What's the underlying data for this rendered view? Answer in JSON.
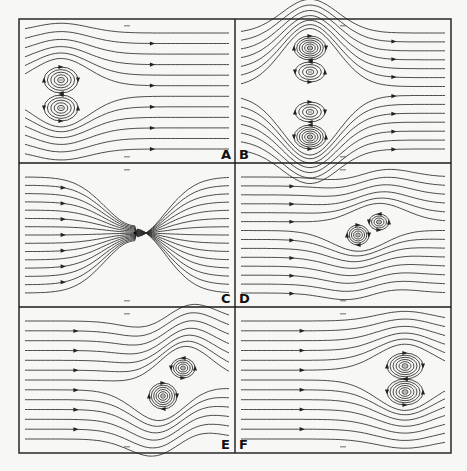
{
  "figure": {
    "frame": {
      "left": 19,
      "top": 19,
      "right": 451,
      "bottom": 453,
      "col_split": 235,
      "row_splits": [
        163,
        307
      ]
    },
    "colors": {
      "line": "#2a2a2a",
      "frame": "#1a1a1a",
      "background": "#f7f7f5"
    }
  },
  "panels": [
    {
      "id": "A",
      "label": "A",
      "label_pos": "bottom-right",
      "x0": 19,
      "y0": 19,
      "x1": 235,
      "y1": 163,
      "arrow_x": 152,
      "description": "Vortex pair (upper clockwise / lower counter-clockwise) upstream, uniform flow to the right",
      "vortices": [
        {
          "cx": 61,
          "cy": 80,
          "rings": 5,
          "rx": 17,
          "ry": 13
        },
        {
          "cx": 61,
          "cy": 108,
          "rings": 5,
          "rx": 17,
          "ry": 13
        }
      ],
      "n_streams": 12
    },
    {
      "id": "B",
      "label": "B",
      "label_pos": "bottom-left",
      "x0": 235,
      "y0": 19,
      "x1": 451,
      "y1": 163,
      "arrow_x": 392,
      "description": "Two vortex pairs stacked vertically, flow diverted around them",
      "vortices": [
        {
          "cx": 310,
          "cy": 48,
          "rings": 6,
          "rx": 16,
          "ry": 12
        },
        {
          "cx": 310,
          "cy": 72,
          "rings": 4,
          "rx": 15,
          "ry": 10
        },
        {
          "cx": 310,
          "cy": 112,
          "rings": 4,
          "rx": 15,
          "ry": 10
        },
        {
          "cx": 310,
          "cy": 137,
          "rings": 6,
          "rx": 16,
          "ry": 12
        }
      ],
      "n_streams": 14
    },
    {
      "id": "C",
      "label": "C",
      "label_pos": "bottom-right",
      "x0": 19,
      "y0": 163,
      "x1": 235,
      "y1": 307,
      "arrow_x": 61,
      "description": "Streamlines converging into a point sink/vortex at center",
      "sink": {
        "cx": 135,
        "cy": 233
      },
      "n_streams": 15
    },
    {
      "id": "D",
      "label": "D",
      "label_pos": "bottom-left",
      "x0": 235,
      "y0": 163,
      "x1": 451,
      "y1": 307,
      "arrow_x": 290,
      "description": "Vortex pair rotated diagonally, S-shaped streamlines",
      "vortices": [
        {
          "cx": 358,
          "cy": 235,
          "rings": 5,
          "rx": 11,
          "ry": 10
        },
        {
          "cx": 379,
          "cy": 222,
          "rings": 4,
          "rx": 10,
          "ry": 8
        }
      ],
      "n_streams": 14
    },
    {
      "id": "E",
      "label": "E",
      "label_pos": "bottom-right",
      "x0": 19,
      "y0": 307,
      "x1": 235,
      "y1": 453,
      "arrow_x": 74,
      "description": "Vortex pair tilted, shifted downstream with S-shaped wrap",
      "vortices": [
        {
          "cx": 163,
          "cy": 396,
          "rings": 6,
          "rx": 14,
          "ry": 13
        },
        {
          "cx": 183,
          "cy": 368,
          "rings": 5,
          "rx": 12,
          "ry": 10
        }
      ],
      "n_streams": 13
    },
    {
      "id": "F",
      "label": "F",
      "label_pos": "bottom-left",
      "x0": 235,
      "y0": 307,
      "x1": 451,
      "y1": 453,
      "arrow_x": 302,
      "description": "Vortex pair downstream near right edge, stacked vertically",
      "vortices": [
        {
          "cx": 405,
          "cy": 366,
          "rings": 6,
          "rx": 18,
          "ry": 13
        },
        {
          "cx": 405,
          "cy": 392,
          "rings": 6,
          "rx": 18,
          "ry": 13
        }
      ],
      "n_streams": 13
    }
  ]
}
